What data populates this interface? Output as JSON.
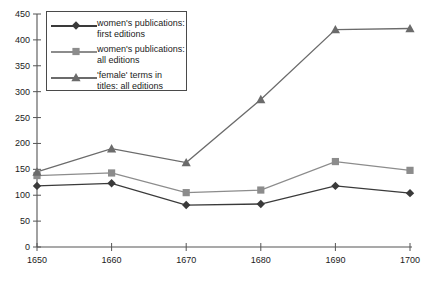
{
  "chart_data": {
    "type": "line",
    "title": "",
    "xlabel": "",
    "ylabel": "",
    "x": [
      1650,
      1660,
      1670,
      1680,
      1690,
      1700
    ],
    "categories": [
      "1650",
      "1660",
      "1670",
      "1680",
      "1690",
      "1700"
    ],
    "xlim": [
      1650,
      1700
    ],
    "ylim": [
      0,
      450
    ],
    "yticks": [
      0,
      50,
      100,
      150,
      200,
      250,
      300,
      350,
      400,
      450
    ],
    "xticks": [
      1650,
      1660,
      1670,
      1680,
      1690,
      1700
    ],
    "grid": false,
    "legend_position": "upper-left-inside",
    "series": [
      {
        "name": "women's publications:\nfirst editions",
        "marker": "diamond",
        "color": "#3a3a3a",
        "values": [
          118,
          123,
          81,
          83,
          118,
          104
        ]
      },
      {
        "name": "women's publications:\nall editions",
        "marker": "square",
        "color": "#8c8c8c",
        "values": [
          138,
          143,
          105,
          110,
          165,
          148
        ]
      },
      {
        "name": "'female' terms in\ntitles: all editions",
        "marker": "triangle",
        "color": "#6b6b6b",
        "values": [
          145,
          190,
          163,
          285,
          420,
          422
        ]
      }
    ]
  },
  "axis": {
    "y_tick_labels": [
      "450",
      "400",
      "350",
      "300",
      "250",
      "200",
      "150",
      "100",
      "50",
      "0"
    ],
    "x_tick_labels": [
      "1650",
      "1660",
      "1670",
      "1680",
      "1690",
      "1700"
    ]
  },
  "legend": {
    "entries": [
      {
        "label": "women's publications:\nfirst editions",
        "marker": "diamond-marker",
        "color": "#3a3a3a"
      },
      {
        "label": "women's publications:\nall editions",
        "marker": "square-marker",
        "color": "#8c8c8c"
      },
      {
        "label": "'female' terms in\ntitles: all editions",
        "marker": "triangle-marker",
        "color": "#6b6b6b"
      }
    ]
  },
  "colors": {
    "axis": "#555555",
    "background": "#ffffff",
    "text": "#1b1b1b",
    "series_first_editions": "#3a3a3a",
    "series_all_editions": "#8c8c8c",
    "series_female_terms": "#6b6b6b"
  }
}
